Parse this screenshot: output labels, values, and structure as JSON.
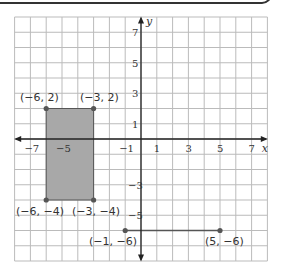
{
  "axes": {
    "x_label": "x",
    "y_label": "y"
  },
  "x_ticks": [
    {
      "v": -7,
      "t": "−7"
    },
    {
      "v": -5,
      "t": "−5"
    },
    {
      "v": -1,
      "t": "−1"
    },
    {
      "v": 1,
      "t": "1"
    },
    {
      "v": 3,
      "t": "3"
    },
    {
      "v": 5,
      "t": "5"
    },
    {
      "v": 7,
      "t": "7"
    }
  ],
  "y_ticks": [
    {
      "v": 7,
      "t": "7"
    },
    {
      "v": 5,
      "t": "5"
    },
    {
      "v": 3,
      "t": "3"
    },
    {
      "v": 1,
      "t": "1"
    },
    {
      "v": -3,
      "t": "−3"
    },
    {
      "v": -5,
      "t": "−5"
    }
  ],
  "rectangle": {
    "fill": "#a8a8a8",
    "points": [
      {
        "label": "(−6, 2)",
        "x": -6,
        "y": 2
      },
      {
        "label": "(−3, 2)",
        "x": -3,
        "y": 2
      },
      {
        "label": "(−6, −4)",
        "x": -6,
        "y": -4
      },
      {
        "label": "(−3, −4)",
        "x": -3,
        "y": -4
      }
    ]
  },
  "segment": {
    "points": [
      {
        "label": "(−1, −6)",
        "x": -1,
        "y": -6
      },
      {
        "label": "(5, −6)",
        "x": 5,
        "y": -6
      }
    ]
  },
  "labels": {
    "p1": "(−6, 2)",
    "p2": "(−3, 2)",
    "p3": "(−6, −4)",
    "p4": "(−3, −4)",
    "p5": "(−1, −6)",
    "p6": "(5, −6)"
  }
}
